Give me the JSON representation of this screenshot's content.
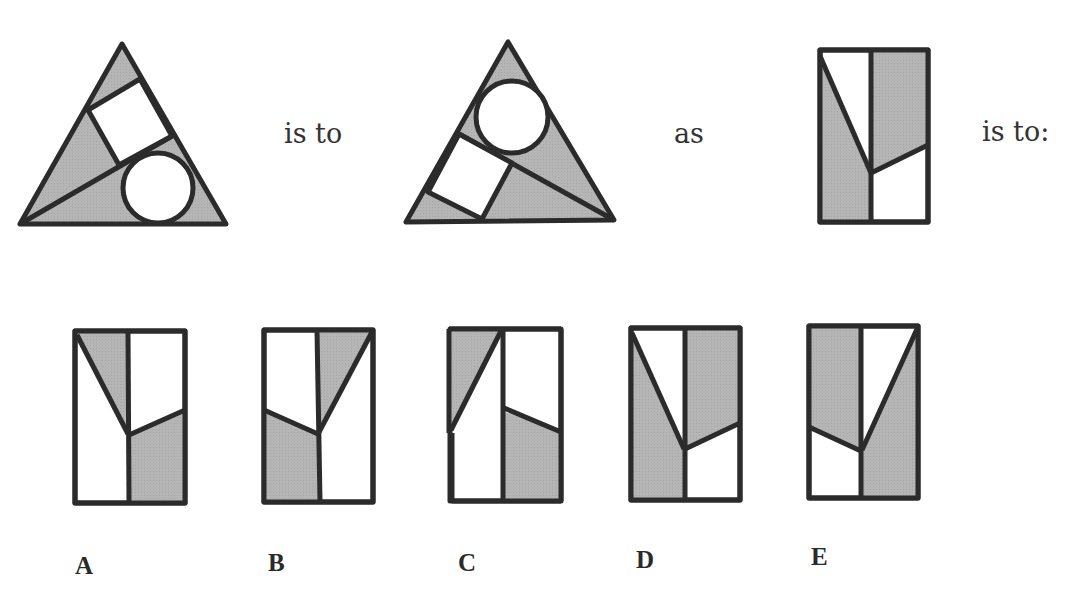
{
  "puzzle": {
    "type": "visual-analogy",
    "connectors": {
      "is_to_1": "is to",
      "as": "as",
      "is_to_2": "is to:"
    },
    "figures": {
      "premise_a": "triangle-with-square-and-circle",
      "premise_b": "triangle-with-circle-and-square-rearranged",
      "query": "rectangle-divided-with-diagonal-and-slanted-line"
    },
    "options": [
      {
        "label": "A"
      },
      {
        "label": "B"
      },
      {
        "label": "C"
      },
      {
        "label": "D"
      },
      {
        "label": "E"
      }
    ]
  },
  "colors": {
    "shade": "#b3b3b3",
    "stroke": "#2b2b2b",
    "background": "#ffffff"
  }
}
